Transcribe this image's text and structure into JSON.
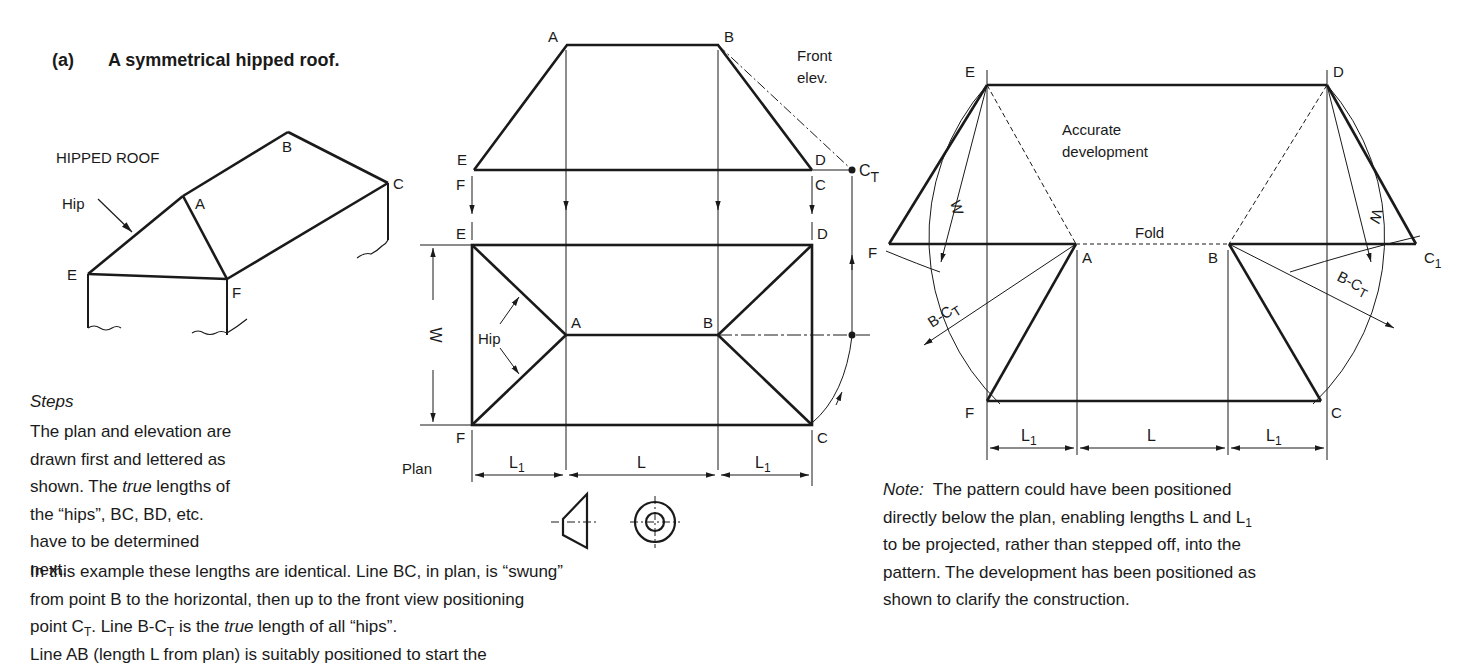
{
  "heading": {
    "label": "(a)",
    "title": "A symmetrical hipped roof."
  },
  "pictorial": {
    "caption": "HIPPED ROOF",
    "hip_label": "Hip",
    "points": [
      "A",
      "B",
      "C",
      "E",
      "F"
    ]
  },
  "elevation": {
    "caption_line1": "Front",
    "caption_line2": "elev.",
    "points": {
      "A": "A",
      "B": "B",
      "E": "E",
      "D": "D",
      "F": "F",
      "C": "C",
      "CT": "C",
      "CT_sub": "T"
    }
  },
  "plan": {
    "caption": "Plan",
    "hip_label": "Hip",
    "width_label": "W",
    "points": {
      "E": "E",
      "D": "D",
      "F": "F",
      "C": "C",
      "A": "A",
      "B": "B"
    },
    "dims": {
      "L1_left": "L",
      "L1_left_sub": "1",
      "L": "L",
      "L1_right": "L",
      "L1_right_sub": "1"
    }
  },
  "projection_symbol": {
    "name": "first-angle projection symbol"
  },
  "development": {
    "caption_line1": "Accurate",
    "caption_line2": "development",
    "fold_label": "Fold",
    "w_label": "W",
    "bct_label": "B-C",
    "bct_sub": "T",
    "points": {
      "E": "E",
      "D": "D",
      "F": "F",
      "A": "A",
      "B": "B",
      "C1": "C",
      "C1_sub": "1",
      "F2": "F",
      "C": "C"
    },
    "dims": {
      "L1_left": "L",
      "L1_left_sub": "1",
      "L": "L",
      "L1_right": "L",
      "L1_right_sub": "1"
    }
  },
  "steps": {
    "heading": "Steps",
    "col_lines": [
      "The plan and elevation are",
      "drawn first and lettered as"
    ],
    "line3_a": "shown.  The ",
    "line3_italic": "true",
    "line3_b": " lengths of",
    "line4": "the “hips”, BC, BD, etc.",
    "line5": "have to be determined next.",
    "wide1": "In this example these lengths are identical.  Line BC, in plan, is “swung”",
    "wide2": "from point B to the horizontal, then up to the front view positioning",
    "wide3_a": "point C",
    "wide3_sub": "T",
    "wide3_b": ".  Line B-C",
    "wide3_sub2": "T",
    "wide3_c": " is the ",
    "wide3_italic": "true",
    "wide3_d": " length of all “hips”.",
    "wide4": "Line AB (length L from plan) is suitably positioned to start the"
  },
  "note": {
    "label": "Note:",
    "line1": "  The pattern could have been positioned",
    "line2_a": "directly below the plan, enabling lengths L and L",
    "line2_sub": "1",
    "line3": "to be projected, rather than stepped off, into the",
    "line4": "pattern.  The development has been positioned as",
    "line5": "shown to clarify the construction."
  }
}
